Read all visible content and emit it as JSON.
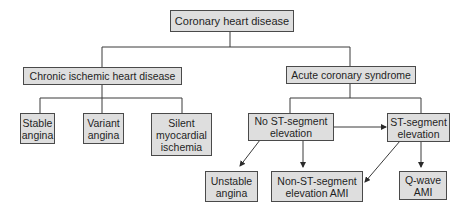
{
  "diagram": {
    "nodes": {
      "root": "Coronary heart disease",
      "chronic": "Chronic ischemic heart disease",
      "acute": "Acute coronary syndrome",
      "stable": "Stable\nangina",
      "variant": "Variant\nangina",
      "silent": "Silent\nmyocardial\nischemia",
      "no_st": "No ST-segment\nelevation",
      "st": "ST-segment\nelevation",
      "unstable": "Unstable\nangina",
      "nstemi": "Non-ST-segment\nelevation AMI",
      "qwave": "Q-wave\nAMI"
    },
    "edges": [
      {
        "from": "root",
        "to": "chronic",
        "type": "line"
      },
      {
        "from": "root",
        "to": "acute",
        "type": "line"
      },
      {
        "from": "chronic",
        "to": "stable",
        "type": "line"
      },
      {
        "from": "chronic",
        "to": "variant",
        "type": "line"
      },
      {
        "from": "chronic",
        "to": "silent",
        "type": "line"
      },
      {
        "from": "acute",
        "to": "no_st",
        "type": "line"
      },
      {
        "from": "acute",
        "to": "st",
        "type": "line"
      },
      {
        "from": "no_st",
        "to": "st",
        "type": "arrow"
      },
      {
        "from": "no_st",
        "to": "unstable",
        "type": "arrow"
      },
      {
        "from": "no_st",
        "to": "nstemi",
        "type": "arrow"
      },
      {
        "from": "st",
        "to": "nstemi",
        "type": "arrow"
      },
      {
        "from": "st",
        "to": "qwave",
        "type": "arrow"
      }
    ],
    "colors": {
      "box_fill": "#dedede",
      "box_border": "#4a4a4a",
      "line": "#3a3a3a",
      "background": "#ffffff"
    }
  }
}
